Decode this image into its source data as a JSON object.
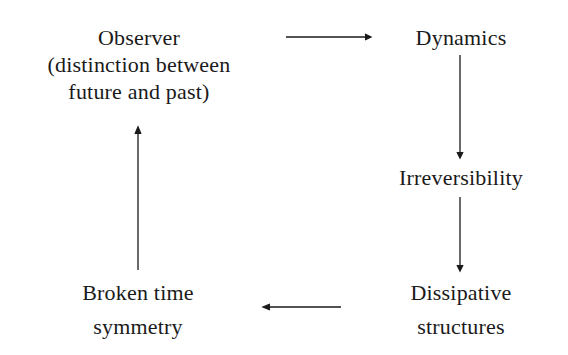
{
  "diagram": {
    "nodes": {
      "observer": {
        "lines": [
          "Observer",
          "(distinction between",
          "future and past)"
        ]
      },
      "dynamics": {
        "lines": [
          "Dynamics"
        ]
      },
      "irreversibility": {
        "lines": [
          "Irreversibility"
        ]
      },
      "dissipative": {
        "lines": [
          "Dissipative",
          "structures"
        ]
      },
      "broken_symmetry": {
        "lines": [
          "Broken time",
          "symmetry"
        ]
      }
    },
    "edges": [
      {
        "from": "observer",
        "to": "dynamics",
        "direction": "right"
      },
      {
        "from": "dynamics",
        "to": "irreversibility",
        "direction": "down"
      },
      {
        "from": "irreversibility",
        "to": "dissipative",
        "direction": "down"
      },
      {
        "from": "dissipative",
        "to": "broken_symmetry",
        "direction": "left"
      },
      {
        "from": "broken_symmetry",
        "to": "observer",
        "direction": "up"
      }
    ],
    "colors": {
      "ink": "#1a1a1a",
      "background": "#ffffff"
    }
  }
}
